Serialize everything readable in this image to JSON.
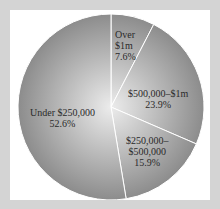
{
  "chart_data": {
    "type": "pie",
    "title": "",
    "start_angle": "12 o'clock",
    "direction": "clockwise",
    "categories": [
      "Over $1m",
      "$500,000–$1m",
      "$250,000–$500,000",
      "Under $250,000"
    ],
    "values": [
      7.6,
      23.9,
      15.9,
      52.6
    ],
    "unit": "%",
    "slices": [
      {
        "label_lines": [
          "Over",
          "$1m"
        ],
        "value_text": "7.6%",
        "value": 7.6
      },
      {
        "label_lines": [
          "$500,000–$1m"
        ],
        "value_text": "23.9%",
        "value": 23.9
      },
      {
        "label_lines": [
          "$250,000–",
          "$500,000"
        ],
        "value_text": "15.9%",
        "value": 15.9
      },
      {
        "label_lines": [
          "Under $250,000"
        ],
        "value_text": "52.6%",
        "value": 52.6
      }
    ],
    "legend": "none (labels inside slices)",
    "colors": {
      "fill_center": "#ececec",
      "fill_edge": "#8c8c8c",
      "divider": "#ffffff",
      "background": "#ffffff",
      "border": "#d4d4d4"
    }
  }
}
